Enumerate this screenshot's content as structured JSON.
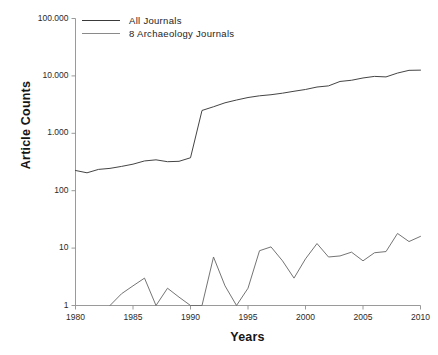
{
  "chart_data": {
    "type": "line",
    "title": "",
    "xlabel": "Years",
    "ylabel": "Article Counts",
    "yscale": "log",
    "ylim": [
      1,
      100000
    ],
    "xlim": [
      1980,
      2010
    ],
    "grid": false,
    "legend_position": "top-left",
    "ytick_labels": [
      "100.000",
      "10.000",
      "1.000",
      "100",
      "10",
      "1"
    ],
    "ytick_values": [
      100000,
      10000,
      1000,
      100,
      10,
      1
    ],
    "xtick_labels": [
      "1980",
      "1985",
      "1990",
      "1995",
      "2000",
      "2005",
      "2010"
    ],
    "xtick_values": [
      1980,
      1985,
      1990,
      1995,
      2000,
      2005,
      2010
    ],
    "series": [
      {
        "name": "All Journals",
        "color": "#3a3a3a",
        "x": [
          1980,
          1981,
          1982,
          1983,
          1984,
          1985,
          1986,
          1987,
          1988,
          1989,
          1990,
          1991,
          1992,
          1993,
          1994,
          1995,
          1996,
          1997,
          1998,
          1999,
          2000,
          2001,
          2002,
          2003,
          2004,
          2005,
          2006,
          2007,
          2008,
          2009,
          2010
        ],
        "values": [
          225,
          205,
          235,
          245,
          265,
          290,
          330,
          345,
          320,
          325,
          375,
          2500,
          2900,
          3400,
          3800,
          4200,
          4500,
          4700,
          5000,
          5400,
          5800,
          6400,
          6700,
          8000,
          8400,
          9200,
          9800,
          9600,
          11200,
          12500,
          12600
        ]
      },
      {
        "name": "8 Archaeology Journals",
        "color": "#6d6d6d",
        "x": [
          1983,
          1984,
          1985,
          1986,
          1987,
          1988,
          1989,
          1990,
          1991,
          1992,
          1993,
          1994,
          1995,
          1996,
          1997,
          1998,
          1999,
          2000,
          2001,
          2002,
          2003,
          2004,
          2005,
          2006,
          2007,
          2008,
          2009,
          2010
        ],
        "values": [
          1,
          1.6,
          2.2,
          3,
          1,
          2,
          1.4,
          1,
          1,
          7,
          2.2,
          1,
          2,
          9,
          10.5,
          6,
          3,
          6.5,
          12,
          7,
          7.3,
          8.5,
          6,
          8.3,
          8.7,
          18,
          13,
          16
        ]
      }
    ]
  },
  "legend": {
    "items": [
      {
        "label": "All Journals"
      },
      {
        "label": "8 Archaeology Journals"
      }
    ]
  },
  "axes": {
    "y_title": "Article Counts",
    "x_title": "Years"
  }
}
